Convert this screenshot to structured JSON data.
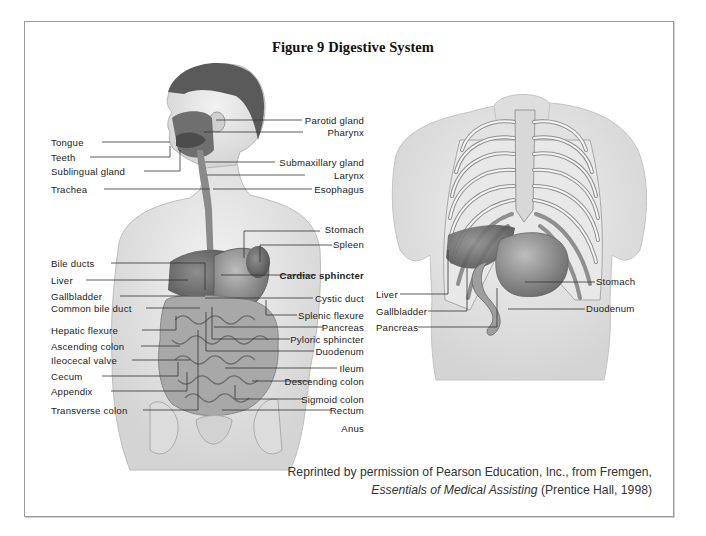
{
  "figure": {
    "title": "Figure 9  Digestive System",
    "credit_line1": "Reprinted by permission of Pearson Education, Inc., from Fremgen,",
    "credit_book": "Essentials of Medical Assisting",
    "credit_rest": " (Prentice Hall, 1998)"
  },
  "left_figure": {
    "left_labels": [
      {
        "text": "Tongue",
        "y": 142
      },
      {
        "text": "Teeth",
        "y": 157
      },
      {
        "text": "Sublingual gland",
        "y": 171
      },
      {
        "text": "Trachea",
        "y": 189
      },
      {
        "text": "Bile ducts",
        "y": 263
      },
      {
        "text": "Liver",
        "y": 280
      },
      {
        "text": "Gallbladder",
        "y": 296
      },
      {
        "text": "Common bile duct",
        "y": 308
      },
      {
        "text": "Hepatic flexure",
        "y": 330
      },
      {
        "text": "Ascending colon",
        "y": 346
      },
      {
        "text": "Ileocecal valve",
        "y": 360
      },
      {
        "text": "Cecum",
        "y": 376
      },
      {
        "text": "Appendix",
        "y": 391
      },
      {
        "text": "Transverse colon",
        "y": 410
      }
    ],
    "right_labels": [
      {
        "text": "Parotid gland",
        "y": 120,
        "bold": false
      },
      {
        "text": "Pharynx",
        "y": 132,
        "bold": false
      },
      {
        "text": "Submaxillary gland",
        "y": 162,
        "bold": false
      },
      {
        "text": "Larynx",
        "y": 175,
        "bold": false
      },
      {
        "text": "Esophagus",
        "y": 189,
        "bold": false
      },
      {
        "text": "Stomach",
        "y": 229,
        "bold": false
      },
      {
        "text": "Spleen",
        "y": 244,
        "bold": false
      },
      {
        "text": "Cardiac sphincter",
        "y": 275,
        "bold": true
      },
      {
        "text": "Cystic duct",
        "y": 298,
        "bold": false
      },
      {
        "text": "Splenic flexure",
        "y": 315,
        "bold": false
      },
      {
        "text": "Pancreas",
        "y": 327,
        "bold": false
      },
      {
        "text": "Pyloric sphincter",
        "y": 339,
        "bold": false
      },
      {
        "text": "Duodenum",
        "y": 351,
        "bold": false
      },
      {
        "text": "Ileum",
        "y": 368,
        "bold": false
      },
      {
        "text": "Descending colon",
        "y": 381,
        "bold": false
      },
      {
        "text": "Sigmoid colon",
        "y": 399,
        "bold": false
      },
      {
        "text": "Rectum",
        "y": 410,
        "bold": false
      },
      {
        "text": "Anus",
        "y": 428,
        "bold": false
      }
    ]
  },
  "right_figure": {
    "left_labels": [
      {
        "text": "Liver",
        "y": 294
      },
      {
        "text": "Gallbladder",
        "y": 311
      },
      {
        "text": "Pancreas",
        "y": 327
      }
    ],
    "right_labels": [
      {
        "text": "Stomach",
        "y": 281
      },
      {
        "text": "Duodenum",
        "y": 308
      }
    ]
  },
  "colors": {
    "frame_border": "#9a9a9a",
    "skin": "#e6e6e6",
    "organ_dark": "#6e6e6e",
    "organ_mid": "#9a9a9a",
    "leader_line": "#333333",
    "text": "#222222"
  }
}
